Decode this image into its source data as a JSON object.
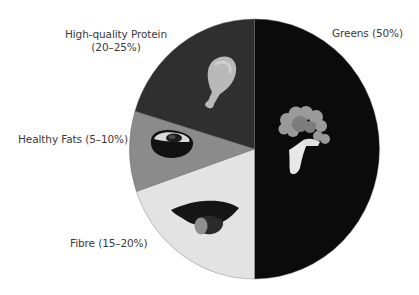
{
  "chart_data": {
    "type": "pie",
    "title": "",
    "start": "12 o'clock",
    "direction": "clockwise",
    "slices": [
      {
        "key": "greens",
        "label": "Greens (50%)",
        "value": 50,
        "color": "#0b0b0b",
        "icon": "broccoli-icon"
      },
      {
        "key": "fibre",
        "label": "Fibre (15–20%)",
        "value": 19.7,
        "color": "#e3e3e3",
        "icon": "sweet-potato-icon"
      },
      {
        "key": "fats",
        "label": "Healthy Fats (5–10%)",
        "value": 10,
        "color": "#8b8b8b",
        "icon": "avocado-icon"
      },
      {
        "key": "protein",
        "label": "High-quality Protein (20–25%)",
        "value": 20.3,
        "color": "#2f2f2f",
        "icon": "chicken-drumstick-icon"
      }
    ],
    "labels": {
      "protein_line1": "High-quality Protein",
      "protein_line2": "(20–25%)",
      "fats": "Healthy Fats (5–10%)",
      "fibre": "Fibre (15–20%)",
      "greens": "Greens (50%)"
    },
    "legend": "none"
  }
}
